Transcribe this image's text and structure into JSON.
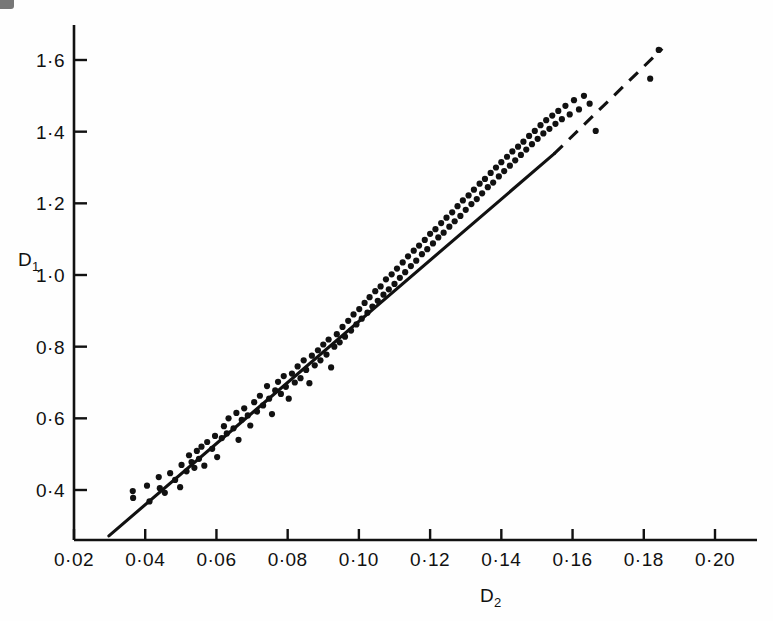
{
  "figure": {
    "background_color": "#fefefe",
    "ink_color": "#111111",
    "width": 773,
    "height": 621
  },
  "axes": {
    "x_title": "D",
    "x_title_sub": "2",
    "y_title": "D",
    "y_title_sub": "1",
    "x_tick_labels": [
      "0·02",
      "0·04",
      "0·06",
      "0·08",
      "0·10",
      "0·12",
      "0·14",
      "0·16",
      "0·18",
      "0·20"
    ],
    "y_tick_labels": [
      "0·4",
      "0·6",
      "0·8",
      "1·0",
      "1·2",
      "1·4",
      "1·6"
    ]
  },
  "chart_data": {
    "type": "scatter",
    "title": "",
    "xlabel": "D2",
    "ylabel": "D1",
    "xlim": [
      0.0165,
      0.2125
    ],
    "ylim": [
      0.255,
      1.695
    ],
    "grid": false,
    "legend": null,
    "x_ticks": [
      0.02,
      0.04,
      0.06,
      0.08,
      0.1,
      0.12,
      0.14,
      0.16,
      0.18,
      0.2
    ],
    "y_ticks": [
      0.4,
      0.6,
      0.8,
      1.0,
      1.2,
      1.4,
      1.6
    ],
    "x_tick_labels": [
      "0·02",
      "0·04",
      "0·06",
      "0·08",
      "0·10",
      "0·12",
      "0·14",
      "0·16",
      "0·18",
      "0·20"
    ],
    "y_tick_labels": [
      "0·4",
      "0·6",
      "0·8",
      "1·0",
      "1·2",
      "1·4",
      "1·6"
    ],
    "point_marker": "filled-circle",
    "point_radius_px": 3.1,
    "series": [
      {
        "name": "observations",
        "points": [
          [
            0.0365,
            0.397
          ],
          [
            0.0366,
            0.378
          ],
          [
            0.0405,
            0.412
          ],
          [
            0.0412,
            0.368
          ],
          [
            0.0438,
            0.436
          ],
          [
            0.0441,
            0.405
          ],
          [
            0.0455,
            0.392
          ],
          [
            0.047,
            0.447
          ],
          [
            0.0484,
            0.428
          ],
          [
            0.0498,
            0.408
          ],
          [
            0.0502,
            0.47
          ],
          [
            0.0516,
            0.452
          ],
          [
            0.0523,
            0.497
          ],
          [
            0.053,
            0.478
          ],
          [
            0.0538,
            0.462
          ],
          [
            0.0545,
            0.509
          ],
          [
            0.0551,
            0.487
          ],
          [
            0.0558,
            0.521
          ],
          [
            0.0566,
            0.468
          ],
          [
            0.0574,
            0.534
          ],
          [
            0.0588,
            0.515
          ],
          [
            0.0596,
            0.551
          ],
          [
            0.0602,
            0.492
          ],
          [
            0.0615,
            0.545
          ],
          [
            0.0621,
            0.578
          ],
          [
            0.0629,
            0.558
          ],
          [
            0.0634,
            0.6
          ],
          [
            0.0648,
            0.572
          ],
          [
            0.0656,
            0.615
          ],
          [
            0.0662,
            0.54
          ],
          [
            0.0671,
            0.596
          ],
          [
            0.0678,
            0.628
          ],
          [
            0.0688,
            0.608
          ],
          [
            0.0695,
            0.58
          ],
          [
            0.0706,
            0.645
          ],
          [
            0.0714,
            0.619
          ],
          [
            0.0722,
            0.663
          ],
          [
            0.0731,
            0.636
          ],
          [
            0.0742,
            0.69
          ],
          [
            0.0748,
            0.655
          ],
          [
            0.0756,
            0.612
          ],
          [
            0.0765,
            0.678
          ],
          [
            0.0773,
            0.702
          ],
          [
            0.0781,
            0.668
          ],
          [
            0.0789,
            0.718
          ],
          [
            0.0795,
            0.688
          ],
          [
            0.0803,
            0.655
          ],
          [
            0.0812,
            0.725
          ],
          [
            0.082,
            0.7
          ],
          [
            0.0828,
            0.745
          ],
          [
            0.0836,
            0.712
          ],
          [
            0.0845,
            0.762
          ],
          [
            0.0852,
            0.735
          ],
          [
            0.0861,
            0.698
          ],
          [
            0.0868,
            0.775
          ],
          [
            0.0876,
            0.748
          ],
          [
            0.0885,
            0.79
          ],
          [
            0.0892,
            0.762
          ],
          [
            0.09,
            0.806
          ],
          [
            0.0909,
            0.778
          ],
          [
            0.0915,
            0.82
          ],
          [
            0.0922,
            0.742
          ],
          [
            0.0931,
            0.8
          ],
          [
            0.0938,
            0.835
          ],
          [
            0.0946,
            0.812
          ],
          [
            0.0954,
            0.855
          ],
          [
            0.0961,
            0.828
          ],
          [
            0.097,
            0.872
          ],
          [
            0.0978,
            0.845
          ],
          [
            0.0985,
            0.89
          ],
          [
            0.0993,
            0.862
          ],
          [
            0.1001,
            0.905
          ],
          [
            0.1008,
            0.878
          ],
          [
            0.1016,
            0.922
          ],
          [
            0.1024,
            0.895
          ],
          [
            0.103,
            0.938
          ],
          [
            0.1038,
            0.912
          ],
          [
            0.1046,
            0.955
          ],
          [
            0.1053,
            0.928
          ],
          [
            0.1061,
            0.968
          ],
          [
            0.1069,
            0.945
          ],
          [
            0.1076,
            0.988
          ],
          [
            0.1084,
            0.96
          ],
          [
            0.1092,
            1.002
          ],
          [
            0.11,
            0.975
          ],
          [
            0.1107,
            1.018
          ],
          [
            0.1115,
            0.992
          ],
          [
            0.1123,
            1.035
          ],
          [
            0.113,
            1.008
          ],
          [
            0.1138,
            1.052
          ],
          [
            0.1146,
            1.025
          ],
          [
            0.1154,
            1.068
          ],
          [
            0.1161,
            1.04
          ],
          [
            0.1169,
            1.082
          ],
          [
            0.1177,
            1.058
          ],
          [
            0.1185,
            1.098
          ],
          [
            0.1192,
            1.072
          ],
          [
            0.12,
            1.115
          ],
          [
            0.1208,
            1.088
          ],
          [
            0.1215,
            1.128
          ],
          [
            0.1223,
            1.105
          ],
          [
            0.1231,
            1.145
          ],
          [
            0.1238,
            1.118
          ],
          [
            0.1246,
            1.16
          ],
          [
            0.1254,
            1.135
          ],
          [
            0.1262,
            1.175
          ],
          [
            0.1269,
            1.15
          ],
          [
            0.1277,
            1.192
          ],
          [
            0.1285,
            1.165
          ],
          [
            0.1292,
            1.208
          ],
          [
            0.13,
            1.182
          ],
          [
            0.1308,
            1.222
          ],
          [
            0.1316,
            1.198
          ],
          [
            0.1323,
            1.238
          ],
          [
            0.1331,
            1.212
          ],
          [
            0.1339,
            1.255
          ],
          [
            0.1346,
            1.228
          ],
          [
            0.1354,
            1.268
          ],
          [
            0.1362,
            1.245
          ],
          [
            0.137,
            1.285
          ],
          [
            0.1377,
            1.258
          ],
          [
            0.1385,
            1.3
          ],
          [
            0.1393,
            1.275
          ],
          [
            0.14,
            1.315
          ],
          [
            0.1408,
            1.29
          ],
          [
            0.1416,
            1.33
          ],
          [
            0.1424,
            1.305
          ],
          [
            0.1431,
            1.345
          ],
          [
            0.1439,
            1.32
          ],
          [
            0.1447,
            1.358
          ],
          [
            0.1455,
            1.335
          ],
          [
            0.1462,
            1.372
          ],
          [
            0.147,
            1.35
          ],
          [
            0.1478,
            1.388
          ],
          [
            0.1486,
            1.365
          ],
          [
            0.1494,
            1.402
          ],
          [
            0.1502,
            1.38
          ],
          [
            0.151,
            1.418
          ],
          [
            0.1518,
            1.395
          ],
          [
            0.1526,
            1.432
          ],
          [
            0.1535,
            1.408
          ],
          [
            0.1543,
            1.445
          ],
          [
            0.1552,
            1.422
          ],
          [
            0.156,
            1.458
          ],
          [
            0.157,
            1.435
          ],
          [
            0.158,
            1.472
          ],
          [
            0.1592,
            1.448
          ],
          [
            0.1604,
            1.488
          ],
          [
            0.1618,
            1.462
          ],
          [
            0.1632,
            1.5
          ],
          [
            0.1648,
            1.478
          ],
          [
            0.1665,
            1.402
          ],
          [
            0.1842,
            1.628
          ],
          [
            0.1818,
            1.548
          ]
        ]
      }
    ],
    "fit_line": {
      "name": "regression-line",
      "style_solid_segment": {
        "x0": 0.0298,
        "y0": 0.272,
        "x1": 0.1548,
        "y1": 1.338
      },
      "style_dashed_segment": {
        "x0": 0.1548,
        "y0": 1.338,
        "x1": 0.1852,
        "y1": 1.632
      },
      "dash_pattern": "12,9"
    }
  }
}
